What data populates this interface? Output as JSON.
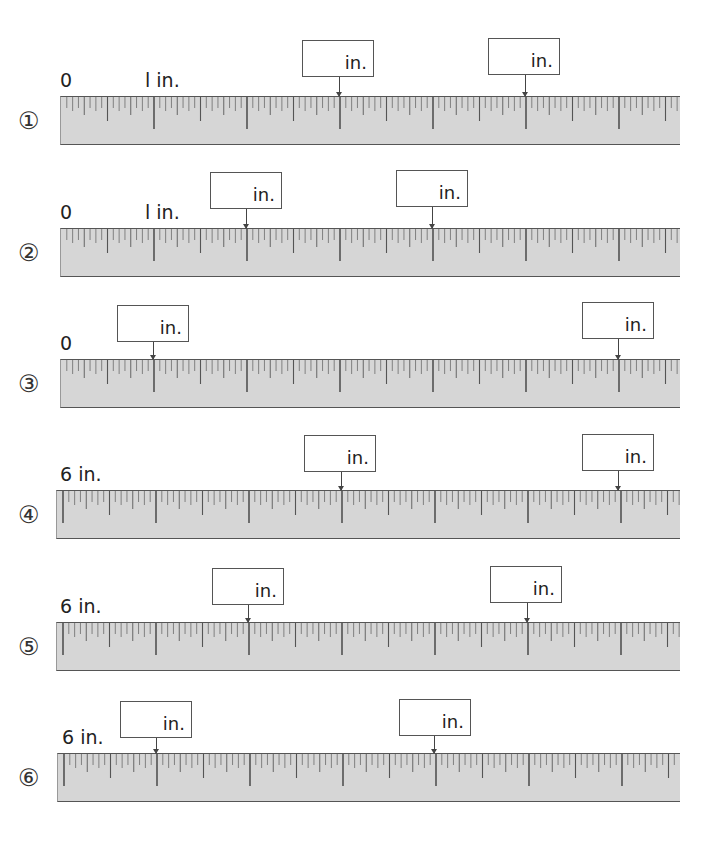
{
  "worksheet": {
    "unit_label": "in.",
    "ruler_color": "#d6d6d6",
    "ticks_per_inch": 16,
    "problems": [
      {
        "number": "①",
        "start_labels": [
          {
            "text": "0",
            "x": 60
          },
          {
            "text": "l in.",
            "x": 145
          }
        ],
        "ruler": {
          "left": 60,
          "right": 680,
          "top": 96,
          "origin_x": 60,
          "inch_px": 93
        },
        "answers": [
          {
            "box_x": 302,
            "box_y": 40,
            "arrow_x": 339,
            "value": "",
            "unit": "in."
          },
          {
            "box_x": 488,
            "box_y": 38,
            "arrow_x": 525,
            "value": "",
            "unit": "in."
          }
        ]
      },
      {
        "number": "②",
        "start_labels": [
          {
            "text": "0",
            "x": 60
          },
          {
            "text": "l in.",
            "x": 145
          }
        ],
        "ruler": {
          "left": 60,
          "right": 680,
          "top": 228,
          "origin_x": 60,
          "inch_px": 93
        },
        "answers": [
          {
            "box_x": 210,
            "box_y": 172,
            "arrow_x": 246,
            "value": "",
            "unit": "in."
          },
          {
            "box_x": 396,
            "box_y": 170,
            "arrow_x": 432,
            "value": "",
            "unit": "in."
          }
        ]
      },
      {
        "number": "③",
        "start_labels": [
          {
            "text": "0",
            "x": 60
          }
        ],
        "ruler": {
          "left": 60,
          "right": 680,
          "top": 359,
          "origin_x": 60,
          "inch_px": 93
        },
        "answers": [
          {
            "box_x": 117,
            "box_y": 305,
            "arrow_x": 153,
            "value": "",
            "unit": "in."
          },
          {
            "box_x": 582,
            "box_y": 302,
            "arrow_x": 618,
            "value": "",
            "unit": "in."
          }
        ]
      },
      {
        "number": "④",
        "start_labels": [
          {
            "text": "6 in.",
            "x": 60
          }
        ],
        "ruler": {
          "left": 56,
          "right": 680,
          "top": 490,
          "origin_x": 62,
          "inch_px": 93
        },
        "answers": [
          {
            "box_x": 304,
            "box_y": 435,
            "arrow_x": 341,
            "value": "",
            "unit": "in."
          },
          {
            "box_x": 582,
            "box_y": 434,
            "arrow_x": 618,
            "value": "",
            "unit": "in."
          }
        ]
      },
      {
        "number": "⑤",
        "start_labels": [
          {
            "text": "6 in.",
            "x": 60
          }
        ],
        "ruler": {
          "left": 56,
          "right": 680,
          "top": 622,
          "origin_x": 62,
          "inch_px": 93
        },
        "answers": [
          {
            "box_x": 212,
            "box_y": 568,
            "arrow_x": 248,
            "value": "",
            "unit": "in."
          },
          {
            "box_x": 490,
            "box_y": 566,
            "arrow_x": 527,
            "value": "",
            "unit": "in."
          }
        ]
      },
      {
        "number": "⑥",
        "start_labels": [
          {
            "text": "6 in.",
            "x": 62
          }
        ],
        "ruler": {
          "left": 57,
          "right": 680,
          "top": 753,
          "origin_x": 63,
          "inch_px": 93
        },
        "answers": [
          {
            "box_x": 120,
            "box_y": 701,
            "arrow_x": 156,
            "value": "",
            "unit": "in."
          },
          {
            "box_x": 399,
            "box_y": 699,
            "arrow_x": 434,
            "value": "",
            "unit": "in."
          }
        ]
      }
    ]
  }
}
